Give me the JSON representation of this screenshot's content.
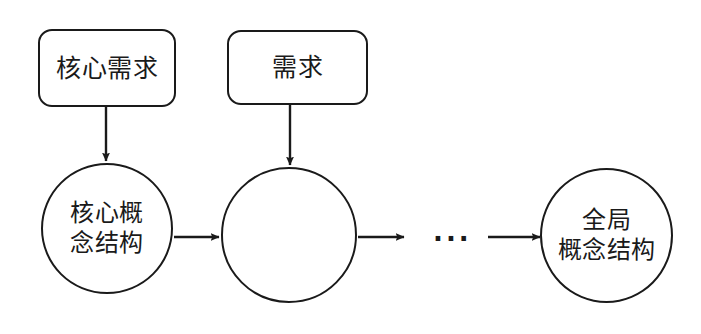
{
  "diagram": {
    "type": "flowchart",
    "background_color": "#ffffff",
    "stroke_color": "#1a1a1a",
    "text_color": "#1a1a1a",
    "nodes": [
      {
        "id": "core-requirement",
        "shape": "rounded-rectangle",
        "label": "核心需求"
      },
      {
        "id": "requirement",
        "shape": "rounded-rectangle",
        "label": "需求"
      },
      {
        "id": "core-concept-structure",
        "shape": "circle",
        "label": "核心概\n念结构"
      },
      {
        "id": "intermediate-concept-structure",
        "shape": "circle",
        "label": ""
      },
      {
        "id": "global-concept-structure",
        "shape": "circle",
        "label": "全局\n概念结构"
      }
    ],
    "ellipsis": "···",
    "edges": [
      {
        "id": "core-requirement-to-core-concept-structure",
        "direction": "down"
      },
      {
        "id": "requirement-to-intermediate-concept-structure",
        "direction": "down"
      },
      {
        "id": "core-concept-structure-to-intermediate-concept-structure",
        "direction": "right"
      },
      {
        "id": "intermediate-concept-structure-to-ellipsis",
        "direction": "right"
      },
      {
        "id": "ellipsis-to-global-concept-structure",
        "direction": "right"
      }
    ]
  }
}
